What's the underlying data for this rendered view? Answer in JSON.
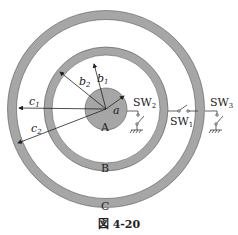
{
  "figure": {
    "caption": "図 4-20",
    "conductors": [
      {
        "id": "A",
        "label": "A",
        "shape": "solid sphere",
        "radius_symbol": "a"
      },
      {
        "id": "B",
        "label": "B",
        "shape": "spherical shell",
        "inner_radius_symbol": "b1",
        "outer_radius_symbol": "b2"
      },
      {
        "id": "C",
        "label": "C",
        "shape": "spherical shell",
        "inner_radius_symbol": "c1",
        "outer_radius_symbol": "c2"
      }
    ],
    "radius_labels": {
      "a": "a",
      "b1": "b",
      "b1_sub": "1",
      "b2": "b",
      "b2_sub": "2",
      "c1": "c",
      "c1_sub": "1",
      "c2": "c",
      "c2_sub": "2"
    },
    "switches": [
      {
        "id": "SW1",
        "label": "SW",
        "sub": "1",
        "connects": "B to C"
      },
      {
        "id": "SW2",
        "label": "SW",
        "sub": "2",
        "connects": "A to ground"
      },
      {
        "id": "SW3",
        "label": "SW",
        "sub": "3",
        "connects": "C to ground"
      }
    ],
    "colors": {
      "conductor": "#a6a6a6",
      "line": "#222222",
      "background": "#ffffff"
    }
  }
}
